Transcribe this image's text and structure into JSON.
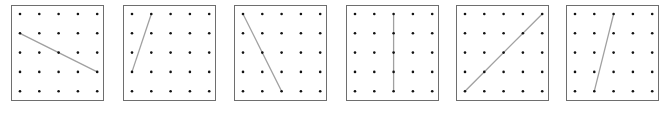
{
  "diagram": {
    "type": "geoboard-line-segments",
    "grid": {
      "cols": 5,
      "rows": 5
    },
    "colors": {
      "border": "#6e6e6e",
      "dot": "#111111",
      "line": "#a0a0a0"
    },
    "panels": [
      {
        "left": 11,
        "segment": {
          "from": [
            0,
            1
          ],
          "to": [
            4,
            3
          ]
        }
      },
      {
        "left": 123,
        "segment": {
          "from": [
            0,
            3
          ],
          "to": [
            1,
            0
          ]
        }
      },
      {
        "left": 234,
        "segment": {
          "from": [
            0,
            0
          ],
          "to": [
            2,
            4
          ]
        }
      },
      {
        "left": 346,
        "segment": {
          "from": [
            2,
            0
          ],
          "to": [
            2,
            4
          ]
        }
      },
      {
        "left": 456,
        "segment": {
          "from": [
            0,
            4
          ],
          "to": [
            4,
            0
          ]
        }
      },
      {
        "left": 566,
        "segment": {
          "from": [
            1,
            4
          ],
          "to": [
            2,
            0
          ]
        }
      }
    ]
  }
}
